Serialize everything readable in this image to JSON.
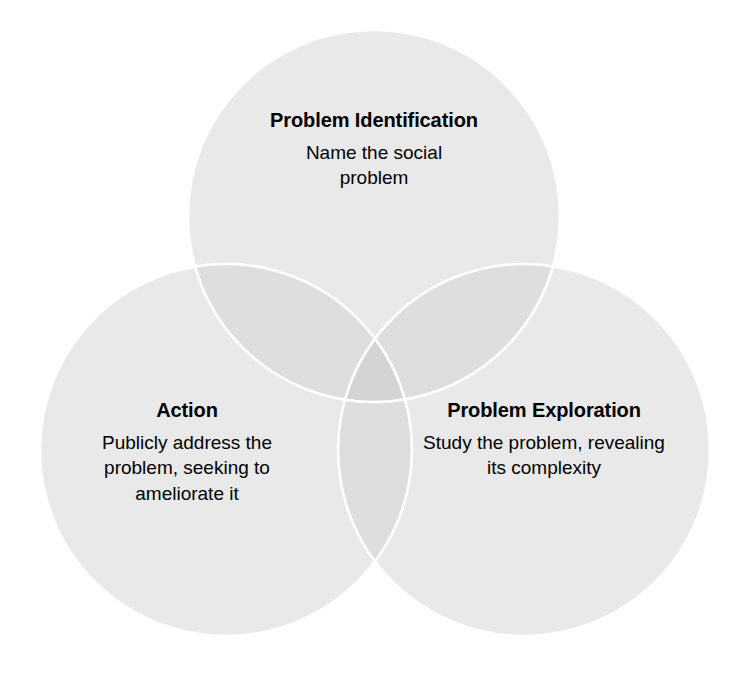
{
  "diagram": {
    "type": "venn",
    "set_count": 3,
    "background_color": "#ffffff",
    "circle_fill_color": "#e9e9e9",
    "circle_stroke_color": "#ffffff",
    "overlap_two_color": "#dedede",
    "overlap_three_color": "#d4d4d4",
    "text_color": "#000000",
    "circles": [
      {
        "id": "problem-identification",
        "position": "top",
        "cx": 374,
        "cy": 216,
        "r": 186,
        "title": "Problem Identification",
        "body": "Name the social problem"
      },
      {
        "id": "action",
        "position": "bottom-left",
        "cx": 226,
        "cy": 450,
        "r": 186,
        "title": "Action",
        "body": "Publicly address the problem, seeking to ameliorate it"
      },
      {
        "id": "problem-exploration",
        "position": "bottom-right",
        "cx": 524,
        "cy": 450,
        "r": 186,
        "title": "Problem Exploration",
        "body": "Study the problem, revealing its complexity"
      }
    ]
  }
}
